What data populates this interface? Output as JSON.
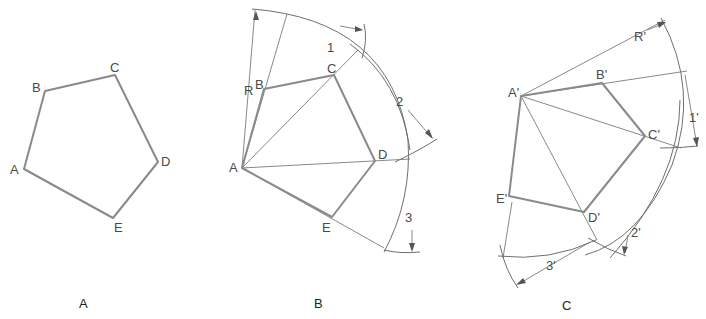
{
  "figure": {
    "captions": {
      "a": "A",
      "b": "B",
      "c": "C"
    },
    "panel_a": {
      "vertex_labels": {
        "A": "A",
        "B": "B",
        "C": "C",
        "D": "D",
        "E": "E"
      }
    },
    "panel_b": {
      "vertex_labels": {
        "A": "A",
        "B": "B",
        "C": "C",
        "D": "D",
        "E": "E"
      },
      "radius_label": "R",
      "chord_labels": [
        "1",
        "2",
        "3"
      ]
    },
    "panel_c": {
      "vertex_labels": {
        "A": "A'",
        "B": "B'",
        "C": "C'",
        "D": "D'",
        "E": "E'"
      },
      "radius_label": "R'",
      "chord_labels": [
        "1'",
        "2'",
        "3'"
      ]
    }
  }
}
